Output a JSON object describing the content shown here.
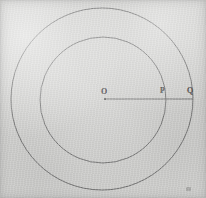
{
  "figure": {
    "background_color": "#d2d2d0",
    "stroke_color": "#5a5a5a",
    "label_color": "#3f3f3f",
    "canvas": {
      "width": 206,
      "height": 198
    }
  },
  "geometry": {
    "center": {
      "x": 103,
      "y": 99
    },
    "outer_circle": {
      "cx": 102,
      "cy": 99,
      "r": 91,
      "stroke_width": 1
    },
    "inner_circle": {
      "cx": 103,
      "cy": 100,
      "r": 63,
      "stroke_width": 1
    },
    "radius_segment": {
      "x1": 105,
      "y1": 99,
      "x2": 193,
      "y2": 99,
      "stroke_width": 1
    },
    "center_dot": {
      "cx": 105,
      "cy": 99,
      "r": 1.1
    }
  },
  "labels": {
    "center": "O",
    "inner_point": "P",
    "outer_point": "Q"
  },
  "chart_data": {
    "type": "diagram",
    "shapes": [
      {
        "name": "outer-circle",
        "kind": "circle",
        "cx": 102,
        "cy": 99,
        "r": 91
      },
      {
        "name": "inner-circle",
        "kind": "circle",
        "cx": 103,
        "cy": 100,
        "r": 63
      },
      {
        "name": "radius-line",
        "kind": "segment",
        "from": "O",
        "to": "Q",
        "passes_through": "P"
      }
    ],
    "points": [
      {
        "label": "O",
        "x": 105,
        "y": 99,
        "role": "common center"
      },
      {
        "label": "P",
        "x": 166,
        "y": 99,
        "role": "intersection with inner circle"
      },
      {
        "label": "Q",
        "x": 193,
        "y": 99,
        "role": "intersection with outer circle"
      }
    ]
  }
}
